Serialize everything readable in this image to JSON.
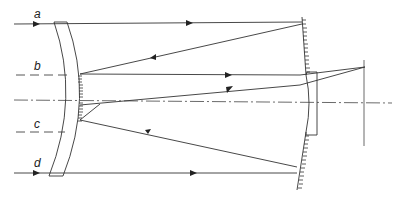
{
  "figure": {
    "ray_labels": [
      "a",
      "b",
      "c",
      "d"
    ]
  },
  "colors": {
    "line": "#333333",
    "background": "#ffffff"
  }
}
